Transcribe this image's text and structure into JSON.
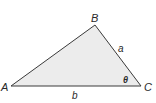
{
  "diagram": {
    "type": "triangle",
    "fill_color": "#ececec",
    "stroke_color": "#3a3a3a",
    "vertices": {
      "A": {
        "label": "A",
        "x": 11,
        "y": 86
      },
      "B": {
        "label": "B",
        "x": 95,
        "y": 25
      },
      "C": {
        "label": "C",
        "x": 141,
        "y": 86
      }
    },
    "sides": {
      "a": {
        "label": "a",
        "between": "B-C"
      },
      "b": {
        "label": "b",
        "between": "A-C"
      }
    },
    "angle": {
      "label": "θ",
      "at": "C"
    }
  }
}
